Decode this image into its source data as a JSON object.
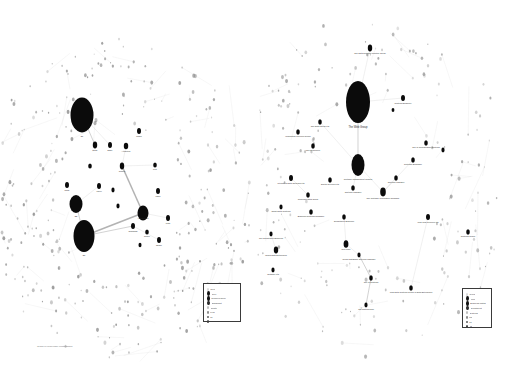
{
  "page": {
    "background_color": "#ffffff",
    "width": 505,
    "height": 366,
    "caption": "Graph of node/edge relationships"
  },
  "panels": [
    {
      "id": "left",
      "name": "left-network-graph",
      "node_color": "#0b0b0b",
      "edge_color": "#c9c9c9",
      "nodes": [
        {
          "x": 82,
          "y": 115,
          "rx": 11.5,
          "ry": 17.5,
          "label": "E1",
          "label_dy": 22,
          "cls": ""
        },
        {
          "x": 76,
          "y": 204,
          "rx": 6.5,
          "ry": 9.0,
          "label": "E2",
          "label_dy": 13,
          "cls": ""
        },
        {
          "x": 84,
          "y": 236,
          "rx": 10.5,
          "ry": 16.0,
          "label": "E3",
          "label_dy": 20,
          "cls": ""
        },
        {
          "x": 143,
          "y": 213,
          "rx": 5.5,
          "ry": 7.5,
          "label": "Architecture",
          "label_dy": 0,
          "cls": ""
        },
        {
          "x": 126,
          "y": 146,
          "rx": 2.2,
          "ry": 3.2,
          "label": "Attributes",
          "label_dy": 6,
          "cls": ""
        },
        {
          "x": 139,
          "y": 131,
          "rx": 2.0,
          "ry": 3.0,
          "label": "Model",
          "label_dy": 6,
          "cls": ""
        },
        {
          "x": 95,
          "y": 145,
          "rx": 2.2,
          "ry": 3.4,
          "label": "Node",
          "label_dy": 6,
          "cls": ""
        },
        {
          "x": 110,
          "y": 145,
          "rx": 2.0,
          "ry": 3.0,
          "label": "Edge",
          "label_dy": 6,
          "cls": ""
        },
        {
          "x": 122,
          "y": 166,
          "rx": 2.2,
          "ry": 3.4,
          "label": "Cluster",
          "label_dy": 6,
          "cls": ""
        },
        {
          "x": 67,
          "y": 185,
          "rx": 2.0,
          "ry": 3.0,
          "label": "Rank",
          "label_dy": 6,
          "cls": ""
        },
        {
          "x": 99,
          "y": 186,
          "rx": 2.0,
          "ry": 3.0,
          "label": "Layer",
          "label_dy": 6,
          "cls": ""
        },
        {
          "x": 155,
          "y": 165,
          "rx": 1.8,
          "ry": 2.6,
          "label": "Port",
          "label_dy": 5,
          "cls": ""
        },
        {
          "x": 158,
          "y": 191,
          "rx": 2.0,
          "ry": 3.0,
          "label": "Label",
          "label_dy": 6,
          "cls": ""
        },
        {
          "x": 133,
          "y": 226,
          "rx": 2.0,
          "ry": 3.0,
          "label": "Subgraph",
          "label_dy": 6,
          "cls": ""
        },
        {
          "x": 147,
          "y": 232,
          "rx": 1.8,
          "ry": 2.6,
          "label": "Spline",
          "label_dy": 5,
          "cls": ""
        },
        {
          "x": 168,
          "y": 218,
          "rx": 2.0,
          "ry": 3.0,
          "label": "Path",
          "label_dy": 6,
          "cls": ""
        },
        {
          "x": 159,
          "y": 240,
          "rx": 2.0,
          "ry": 3.0,
          "label": "Shape",
          "label_dy": 6,
          "cls": ""
        },
        {
          "x": 118,
          "y": 206,
          "rx": 1.6,
          "ry": 2.4,
          "label": "",
          "label_dy": 0,
          "cls": ""
        },
        {
          "x": 113,
          "y": 190,
          "rx": 1.6,
          "ry": 2.4,
          "label": "",
          "label_dy": 0,
          "cls": ""
        },
        {
          "x": 90,
          "y": 166,
          "rx": 1.8,
          "ry": 2.6,
          "label": "",
          "label_dy": 0,
          "cls": ""
        },
        {
          "x": 140,
          "y": 245,
          "rx": 1.5,
          "ry": 2.2,
          "label": "",
          "label_dy": 0,
          "cls": ""
        }
      ],
      "edges": [
        {
          "x1": 84,
          "y1": 236,
          "x2": 143,
          "y2": 213,
          "w": "thick"
        },
        {
          "x1": 143,
          "y1": 213,
          "x2": 122,
          "y2": 166,
          "w": "thick"
        },
        {
          "x1": 84,
          "y1": 236,
          "x2": 133,
          "y2": 226,
          "w": "med"
        },
        {
          "x1": 82,
          "y1": 115,
          "x2": 95,
          "y2": 145,
          "w": "med"
        },
        {
          "x1": 82,
          "y1": 115,
          "x2": 110,
          "y2": 145,
          "w": ""
        },
        {
          "x1": 76,
          "y1": 204,
          "x2": 84,
          "y2": 236,
          "w": "med"
        },
        {
          "x1": 76,
          "y1": 204,
          "x2": 99,
          "y2": 186,
          "w": ""
        },
        {
          "x1": 122,
          "y1": 166,
          "x2": 155,
          "y2": 165,
          "w": ""
        },
        {
          "x1": 122,
          "y1": 166,
          "x2": 126,
          "y2": 146,
          "w": ""
        },
        {
          "x1": 133,
          "y1": 226,
          "x2": 159,
          "y2": 240,
          "w": ""
        },
        {
          "x1": 143,
          "y1": 213,
          "x2": 168,
          "y2": 218,
          "w": ""
        }
      ],
      "legend": {
        "name": "left-legend",
        "items": [
          {
            "label": "Root",
            "color": "#d8d8d8",
            "size": 1.5
          },
          {
            "label": "Core",
            "color": "#111111",
            "size": 2.6
          },
          {
            "label": "Common Node",
            "color": "#111111",
            "size": 2.2
          },
          {
            "label": "Significant",
            "color": "#2b2b2b",
            "size": 2.4
          },
          {
            "label": "Cluster",
            "color": "#bdbdbd",
            "size": 1.6
          },
          {
            "label": "Leaf",
            "color": "#8c8c8c",
            "size": 1.4
          },
          {
            "label": "L1",
            "color": "#6e6e6e",
            "size": 1.3
          },
          {
            "label": "L2",
            "color": "#3d3d3d",
            "size": 1.6
          }
        ]
      }
    },
    {
      "id": "right",
      "name": "right-network-graph",
      "node_color": "#0b0b0b",
      "edge_color": "#c9c9c9",
      "nodes": [
        {
          "x": 105,
          "y": 102,
          "rx": 12.0,
          "ry": 21.0,
          "label": "The Web Group",
          "label_dy": 26,
          "cls": "lg"
        },
        {
          "x": 105,
          "y": 165,
          "rx": 6.5,
          "ry": 11.0,
          "label": "Software Management System",
          "label_dy": 15,
          "cls": ""
        },
        {
          "x": 117,
          "y": 48,
          "rx": 2.2,
          "ry": 3.4,
          "label": "The Data Systems Practice Group",
          "label_dy": 6,
          "cls": ""
        },
        {
          "x": 150,
          "y": 98,
          "rx": 2.0,
          "ry": 3.0,
          "label": "Systems Engineer",
          "label_dy": 6,
          "cls": ""
        },
        {
          "x": 45,
          "y": 132,
          "rx": 1.8,
          "ry": 2.8,
          "label": "Information Services Group",
          "label_dy": 5,
          "cls": ""
        },
        {
          "x": 67,
          "y": 122,
          "rx": 1.8,
          "ry": 2.8,
          "label": "The Data Group Ltd",
          "label_dy": 5,
          "cls": ""
        },
        {
          "x": 60,
          "y": 146,
          "rx": 1.8,
          "ry": 2.8,
          "label": "The Resources",
          "label_dy": 5,
          "cls": ""
        },
        {
          "x": 38,
          "y": 178,
          "rx": 2.0,
          "ry": 3.0,
          "label": "Integrated Data Solutions Ltd",
          "label_dy": 6,
          "cls": ""
        },
        {
          "x": 77,
          "y": 180,
          "rx": 1.8,
          "ry": 2.8,
          "label": "Digital Services Ltd",
          "label_dy": 5,
          "cls": ""
        },
        {
          "x": 55,
          "y": 195,
          "rx": 1.8,
          "ry": 2.8,
          "label": "Corporate Data Group",
          "label_dy": 5,
          "cls": ""
        },
        {
          "x": 100,
          "y": 188,
          "rx": 1.8,
          "ry": 2.8,
          "label": "Systems Manager",
          "label_dy": 5,
          "cls": ""
        },
        {
          "x": 143,
          "y": 178,
          "rx": 1.8,
          "ry": 2.8,
          "label": "Systems Manager",
          "label_dy": 5,
          "cls": ""
        },
        {
          "x": 160,
          "y": 160,
          "rx": 1.8,
          "ry": 2.8,
          "label": "Systems Exchange",
          "label_dy": 5,
          "cls": ""
        },
        {
          "x": 173,
          "y": 143,
          "rx": 1.8,
          "ry": 2.8,
          "label": "The IT Configuration Systems",
          "label_dy": 5,
          "cls": ""
        },
        {
          "x": 130,
          "y": 192,
          "rx": 2.8,
          "ry": 4.4,
          "label": "The Software Information Company",
          "label_dy": 7,
          "cls": ""
        },
        {
          "x": 58,
          "y": 212,
          "rx": 1.8,
          "ry": 2.8,
          "label": "Business Systems Company",
          "label_dy": 5,
          "cls": ""
        },
        {
          "x": 28,
          "y": 207,
          "rx": 1.6,
          "ry": 2.4,
          "label": "Smart Data Systems",
          "label_dy": 5,
          "cls": ""
        },
        {
          "x": 18,
          "y": 234,
          "rx": 1.6,
          "ry": 2.4,
          "label": "The Department Business",
          "label_dy": 5,
          "cls": ""
        },
        {
          "x": 23,
          "y": 250,
          "rx": 2.2,
          "ry": 3.4,
          "label": "Media Data Enterprises",
          "label_dy": 6,
          "cls": ""
        },
        {
          "x": 20,
          "y": 270,
          "rx": 1.6,
          "ry": 2.4,
          "label": "Software Ltd",
          "label_dy": 5,
          "cls": ""
        },
        {
          "x": 91,
          "y": 217,
          "rx": 1.8,
          "ry": 2.8,
          "label": "Department Business",
          "label_dy": 5,
          "cls": ""
        },
        {
          "x": 93,
          "y": 244,
          "rx": 2.4,
          "ry": 3.8,
          "label": "Red Corp",
          "label_dy": 6,
          "cls": ""
        },
        {
          "x": 106,
          "y": 255,
          "rx": 1.6,
          "ry": 2.4,
          "label": "Senior Database Services Manager",
          "label_dy": 5,
          "cls": ""
        },
        {
          "x": 118,
          "y": 278,
          "rx": 1.8,
          "ry": 2.8,
          "label": "The IT Systems",
          "label_dy": 5,
          "cls": ""
        },
        {
          "x": 113,
          "y": 305,
          "rx": 1.6,
          "ry": 2.4,
          "label": "The Data Design",
          "label_dy": 5,
          "cls": ""
        },
        {
          "x": 158,
          "y": 288,
          "rx": 1.8,
          "ry": 2.8,
          "label": "Web Data Systems Group of Data Enterprises",
          "label_dy": 5,
          "cls": ""
        },
        {
          "x": 175,
          "y": 217,
          "rx": 2.0,
          "ry": 3.0,
          "label": "Web Web Services Ltd",
          "label_dy": 6,
          "cls": ""
        },
        {
          "x": 215,
          "y": 232,
          "rx": 1.8,
          "ry": 2.8,
          "label": "Systems Group",
          "label_dy": 5,
          "cls": ""
        },
        {
          "x": 190,
          "y": 150,
          "rx": 1.6,
          "ry": 2.4,
          "label": "",
          "label_dy": 0,
          "cls": ""
        },
        {
          "x": 140,
          "y": 110,
          "rx": 1.4,
          "ry": 2.1,
          "label": "",
          "label_dy": 0,
          "cls": ""
        }
      ],
      "edges": [
        {
          "x1": 105,
          "y1": 102,
          "x2": 117,
          "y2": 48,
          "w": ""
        },
        {
          "x1": 105,
          "y1": 102,
          "x2": 150,
          "y2": 98,
          "w": ""
        },
        {
          "x1": 105,
          "y1": 102,
          "x2": 105,
          "y2": 165,
          "w": "med"
        },
        {
          "x1": 105,
          "y1": 165,
          "x2": 67,
          "y2": 122,
          "w": ""
        },
        {
          "x1": 105,
          "y1": 165,
          "x2": 130,
          "y2": 192,
          "w": ""
        },
        {
          "x1": 105,
          "y1": 165,
          "x2": 100,
          "y2": 188,
          "w": ""
        },
        {
          "x1": 130,
          "y1": 192,
          "x2": 143,
          "y2": 178,
          "w": ""
        },
        {
          "x1": 130,
          "y1": 192,
          "x2": 160,
          "y2": 160,
          "w": ""
        },
        {
          "x1": 93,
          "y1": 244,
          "x2": 106,
          "y2": 255,
          "w": ""
        },
        {
          "x1": 106,
          "y1": 255,
          "x2": 118,
          "y2": 278,
          "w": "med"
        },
        {
          "x1": 118,
          "y1": 278,
          "x2": 113,
          "y2": 305,
          "w": "med"
        },
        {
          "x1": 91,
          "y1": 217,
          "x2": 93,
          "y2": 244,
          "w": ""
        },
        {
          "x1": 175,
          "y1": 217,
          "x2": 158,
          "y2": 288,
          "w": ""
        },
        {
          "x1": 38,
          "y1": 178,
          "x2": 55,
          "y2": 195,
          "w": ""
        },
        {
          "x1": 23,
          "y1": 250,
          "x2": 18,
          "y2": 234,
          "w": ""
        }
      ],
      "legend": {
        "name": "right-legend",
        "items": [
          {
            "label": "Types",
            "color": "#d8d8d8",
            "size": 1.5
          },
          {
            "label": "Firm",
            "color": "#111111",
            "size": 2.6
          },
          {
            "label": "Business Match",
            "color": "#111111",
            "size": 2.2
          },
          {
            "label": "Department",
            "color": "#2b2b2b",
            "size": 2.4
          },
          {
            "label": "Systems",
            "color": "#bdbdbd",
            "size": 1.6
          },
          {
            "label": "Ltd",
            "color": "#8c8c8c",
            "size": 1.4
          },
          {
            "label": "T1",
            "color": "#6e6e6e",
            "size": 1.3
          },
          {
            "label": "T2",
            "color": "#3d3d3d",
            "size": 1.6
          }
        ]
      }
    }
  ],
  "scatter": {
    "left_ring_color": "#8f8f8f",
    "right_ring_color": "#9a9a9a"
  }
}
